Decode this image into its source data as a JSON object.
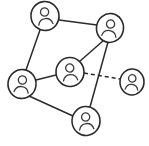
{
  "diagram": {
    "type": "node-link-graph",
    "background_color": "#ffffff",
    "stroke_color": "#2b2b2b",
    "node_icon": "person-icon",
    "node_radius": 13.5,
    "width": 149,
    "height": 146,
    "nodes": [
      {
        "id": "n1",
        "label": "",
        "icon": "person-icon",
        "cx": 45,
        "cy": 16,
        "rx": 14,
        "ry": 14.5,
        "rotate": -6,
        "connected": true
      },
      {
        "id": "n2",
        "label": "",
        "icon": "person-icon",
        "cx": 110,
        "cy": 28,
        "rx": 13.5,
        "ry": 14.5,
        "rotate": 8,
        "connected": true
      },
      {
        "id": "n3",
        "label": "",
        "icon": "person-icon",
        "cx": 70,
        "cy": 72,
        "rx": 14,
        "ry": 14.5,
        "rotate": -4,
        "connected": true
      },
      {
        "id": "n4",
        "label": "",
        "icon": "person-icon",
        "cx": 22,
        "cy": 84,
        "rx": 14,
        "ry": 14.5,
        "rotate": 6,
        "connected": true
      },
      {
        "id": "n5",
        "label": "",
        "icon": "person-icon",
        "cx": 86,
        "cy": 121,
        "rx": 14,
        "ry": 14.5,
        "rotate": -5,
        "connected": true
      },
      {
        "id": "n6",
        "label": "",
        "icon": "person-icon",
        "cx": 132,
        "cy": 82,
        "rx": 12,
        "ry": 13,
        "rotate": 4,
        "connected": false
      }
    ],
    "edges": [
      {
        "id": "e1",
        "from": "n1",
        "to": "n2",
        "style": "solid",
        "x1": 59,
        "y1": 20,
        "x2": 97,
        "y2": 25
      },
      {
        "id": "e2",
        "from": "n1",
        "to": "n4",
        "style": "solid",
        "x1": 40,
        "y1": 30,
        "x2": 26,
        "y2": 70
      },
      {
        "id": "e3",
        "from": "n3",
        "to": "n2",
        "style": "solid",
        "x1": 79,
        "y1": 62,
        "x2": 104,
        "y2": 40
      },
      {
        "id": "e4",
        "from": "n2",
        "to": "n5",
        "style": "solid",
        "x1": 108,
        "y1": 42,
        "x2": 90,
        "y2": 107
      },
      {
        "id": "e5",
        "from": "n4",
        "to": "n3",
        "style": "solid",
        "x1": 36,
        "y1": 80,
        "x2": 56,
        "y2": 75
      },
      {
        "id": "e6",
        "from": "n4",
        "to": "n5",
        "style": "solid",
        "x1": 29,
        "y1": 96,
        "x2": 73,
        "y2": 116
      },
      {
        "id": "e7",
        "from": "n3",
        "to": "n6",
        "style": "dashed",
        "x1": 84,
        "y1": 73,
        "x2": 120,
        "y2": 79
      }
    ],
    "legend": {
      "solid_meaning": "existing connection",
      "dashed_meaning": "potential connection"
    }
  }
}
